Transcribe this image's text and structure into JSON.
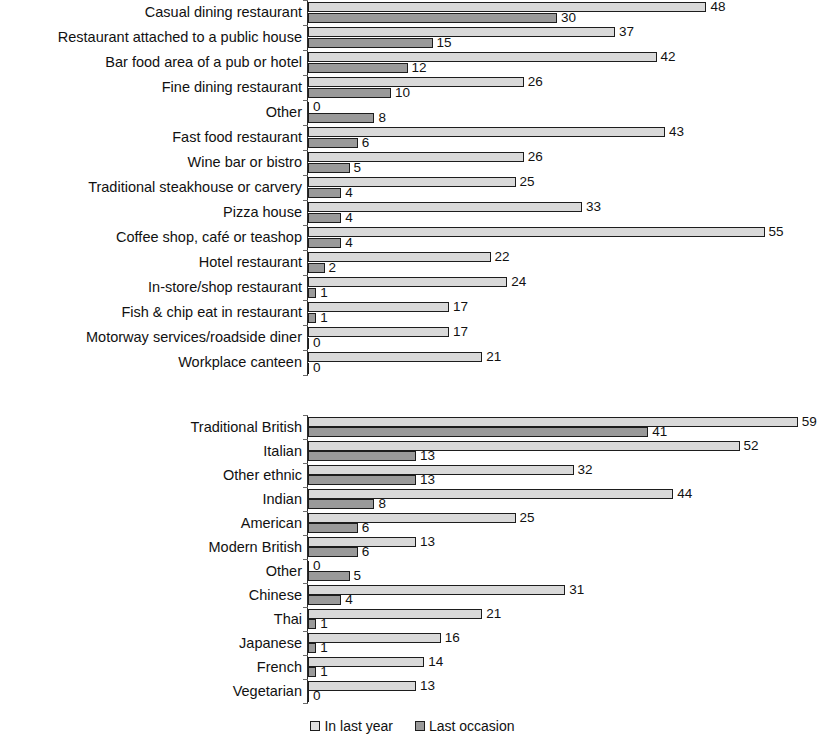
{
  "legend": {
    "items": [
      {
        "label": "In last year",
        "color": "#d9d9d9",
        "key": "in_last_year"
      },
      {
        "label": "Last occasion",
        "color": "#9a9a9a",
        "key": "last_occasion"
      }
    ]
  },
  "chart_data": [
    {
      "type": "bar",
      "orientation": "horizontal",
      "title": "",
      "xlabel": "",
      "ylabel": "",
      "xlim": [
        0,
        60
      ],
      "grid": false,
      "legend_position": "bottom",
      "categories": [
        "Casual dining restaurant",
        "Restaurant attached to a public house",
        "Bar food area of a pub or hotel",
        "Fine dining restaurant",
        "Other",
        "Fast food restaurant",
        "Wine bar or bistro",
        "Traditional steakhouse or carvery",
        "Pizza house",
        "Coffee shop, café or teashop",
        "Hotel restaurant",
        "In-store/shop restaurant",
        "Fish & chip eat in restaurant",
        "Motorway services/roadside diner",
        "Workplace canteen"
      ],
      "series": [
        {
          "name": "In last year",
          "values": [
            48,
            37,
            42,
            26,
            0,
            43,
            26,
            25,
            33,
            55,
            22,
            24,
            17,
            17,
            21
          ]
        },
        {
          "name": "Last occasion",
          "values": [
            30,
            15,
            12,
            10,
            8,
            6,
            5,
            4,
            4,
            4,
            2,
            1,
            1,
            0,
            0
          ]
        }
      ]
    },
    {
      "type": "bar",
      "orientation": "horizontal",
      "title": "",
      "xlabel": "",
      "ylabel": "",
      "xlim": [
        0,
        60
      ],
      "grid": false,
      "legend_position": "bottom",
      "categories": [
        "Traditional British",
        "Italian",
        "Other ethnic",
        "Indian",
        "American",
        "Modern British",
        "Other",
        "Chinese",
        "Thai",
        "Japanese",
        "French",
        "Vegetarian"
      ],
      "series": [
        {
          "name": "In last year",
          "values": [
            59,
            52,
            32,
            44,
            25,
            13,
            0,
            31,
            21,
            16,
            14,
            13
          ]
        },
        {
          "name": "Last occasion",
          "values": [
            41,
            13,
            13,
            8,
            6,
            6,
            5,
            4,
            1,
            1,
            1,
            0
          ]
        }
      ]
    }
  ]
}
